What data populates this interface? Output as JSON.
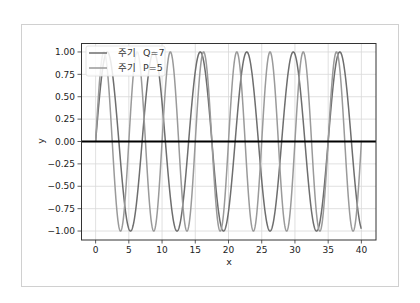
{
  "chart_data": {
    "type": "line",
    "title": "",
    "xlabel": "x",
    "ylabel": "y",
    "xlim": [
      -2.2,
      42.2
    ],
    "ylim": [
      -1.1,
      1.1
    ],
    "x_ticks": [
      0,
      5,
      10,
      15,
      20,
      25,
      30,
      35,
      40
    ],
    "x_tick_labels": [
      "0",
      "5",
      "10",
      "15",
      "20",
      "25",
      "30",
      "35",
      "40"
    ],
    "y_ticks": [
      1.0,
      0.75,
      0.5,
      0.25,
      0.0,
      -0.25,
      -0.5,
      -0.75,
      -1.0
    ],
    "y_tick_labels": [
      "1.00",
      "0.75",
      "0.50",
      "0.25",
      "0.00",
      "−0.25",
      "−0.50",
      "−0.75",
      "−1.00"
    ],
    "grid": true,
    "legend_position": "upper left",
    "x_range": [
      0,
      40
    ],
    "series": [
      {
        "name": "주기  Q=7",
        "function": "sin(2*pi*x/7)",
        "period": 7,
        "color": "#6e6e6e"
      },
      {
        "name": "주기  P=5",
        "function": "sin(2*pi*x/5)",
        "period": 5,
        "color": "#9a9a9a"
      }
    ],
    "reference_lines": [
      {
        "orientation": "horizontal",
        "y": 0,
        "color": "#000000"
      }
    ]
  },
  "legend": {
    "items": [
      {
        "prefix": "주기",
        "label": "Q=7"
      },
      {
        "prefix": "주기",
        "label": "P=5"
      }
    ]
  },
  "axes": {
    "xlabel": "x",
    "ylabel": "y"
  }
}
